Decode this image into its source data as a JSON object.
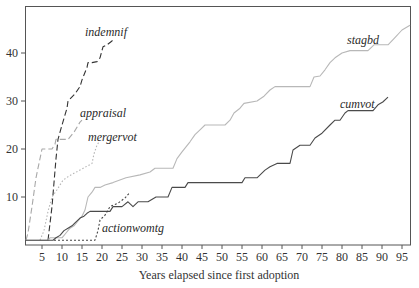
{
  "chart_data": {
    "type": "line",
    "title": "",
    "xlabel": "Years elapsed since first adoption",
    "ylabel": "",
    "xlim": [
      1,
      97
    ],
    "ylim": [
      0,
      50
    ],
    "grid": false,
    "legend": "inline labels",
    "x_ticks": [
      5,
      10,
      15,
      20,
      25,
      30,
      35,
      40,
      45,
      50,
      55,
      60,
      65,
      70,
      75,
      80,
      85,
      90,
      95
    ],
    "y_ticks": [
      10,
      20,
      30,
      40
    ],
    "series": [
      {
        "name": "indemnif",
        "color": "#333333",
        "dash": "6,3",
        "label_at": [
          15.75,
          43.5
        ],
        "points": [
          [
            6.5,
            1
          ],
          [
            7.5,
            8
          ],
          [
            8.5,
            18
          ],
          [
            9,
            22
          ],
          [
            10,
            25
          ],
          [
            11.25,
            28.5
          ],
          [
            11.5,
            30
          ],
          [
            13.25,
            31.5
          ],
          [
            14.5,
            33
          ],
          [
            15,
            34.4
          ],
          [
            16.25,
            37
          ],
          [
            16.5,
            38
          ],
          [
            17.5,
            38
          ],
          [
            18.75,
            38.2
          ],
          [
            19.5,
            39
          ],
          [
            20.25,
            41.3
          ],
          [
            21.25,
            41.7
          ],
          [
            22.5,
            42.5
          ],
          [
            23,
            43
          ]
        ]
      },
      {
        "name": "appraisal",
        "color": "#a8a8a8",
        "dash": "6,3",
        "label_at": [
          14.5,
          26.7
        ],
        "points": [
          [
            1,
            1
          ],
          [
            1.5,
            2.5
          ],
          [
            2.5,
            8
          ],
          [
            3.5,
            14
          ],
          [
            5,
            20
          ],
          [
            7.5,
            20
          ],
          [
            8.25,
            21
          ],
          [
            8.5,
            22
          ],
          [
            11.5,
            22
          ],
          [
            13,
            23.5
          ],
          [
            14.5,
            25.6
          ],
          [
            15,
            26
          ]
        ]
      },
      {
        "name": "mergervot",
        "color": "#b5b5b5",
        "dash": "1.5,2",
        "label_at": [
          16.5,
          21.7
        ],
        "points": [
          [
            4.5,
            1
          ],
          [
            5.5,
            3
          ],
          [
            6.5,
            7
          ],
          [
            7.5,
            10
          ],
          [
            8.75,
            11.5
          ],
          [
            10.25,
            13.5
          ],
          [
            12,
            14.5
          ],
          [
            14.5,
            15.6
          ],
          [
            17.5,
            17
          ],
          [
            18,
            19
          ],
          [
            18.75,
            20.8
          ],
          [
            19.25,
            21.5
          ]
        ]
      },
      {
        "name": "stagbd",
        "color": "#b8b8b8",
        "dash": "",
        "label_at": [
          81.25,
          41.9
        ],
        "points": [
          [
            1,
            1
          ],
          [
            6.5,
            1
          ],
          [
            7,
            1.5
          ],
          [
            10,
            1.5
          ],
          [
            11,
            2.5
          ],
          [
            12,
            3.5
          ],
          [
            13,
            4
          ],
          [
            14,
            5
          ],
          [
            15,
            6
          ],
          [
            15.75,
            7.3
          ],
          [
            16.5,
            10
          ],
          [
            17.5,
            11
          ],
          [
            18.25,
            12
          ],
          [
            19.5,
            12
          ],
          [
            20.75,
            12.5
          ],
          [
            22.75,
            13
          ],
          [
            26,
            14
          ],
          [
            29.5,
            14.6
          ],
          [
            32,
            15.2
          ],
          [
            33.25,
            16
          ],
          [
            37.75,
            16
          ],
          [
            38.75,
            18
          ],
          [
            40,
            19.4
          ],
          [
            42,
            21.5
          ],
          [
            43.25,
            23
          ],
          [
            44.5,
            24
          ],
          [
            45.75,
            25
          ],
          [
            50.75,
            25
          ],
          [
            52,
            26
          ],
          [
            53,
            27.5
          ],
          [
            54.5,
            28.5
          ],
          [
            55.5,
            29.5
          ],
          [
            58.75,
            30
          ],
          [
            60.5,
            31
          ],
          [
            62,
            32.3
          ],
          [
            63.25,
            33
          ],
          [
            72,
            33
          ],
          [
            73,
            35
          ],
          [
            74.5,
            35.2
          ],
          [
            75.75,
            36.5
          ],
          [
            77,
            38
          ],
          [
            78.25,
            39
          ],
          [
            80,
            40
          ],
          [
            82,
            40.5
          ],
          [
            86.5,
            40.5
          ],
          [
            88,
            41.7
          ],
          [
            91.5,
            41.7
          ],
          [
            93,
            43
          ],
          [
            95,
            44.8
          ],
          [
            97,
            45.8
          ]
        ]
      },
      {
        "name": "cumvot",
        "color": "#4a4a4a",
        "dash": "",
        "label_at": [
          79.5,
          28.5
        ],
        "points": [
          [
            1,
            1
          ],
          [
            7.75,
            1
          ],
          [
            8.5,
            1.5
          ],
          [
            9.5,
            2
          ],
          [
            10.5,
            3
          ],
          [
            11.5,
            3.5
          ],
          [
            12.5,
            4
          ],
          [
            13.25,
            4.6
          ],
          [
            14.5,
            5.6
          ],
          [
            15.5,
            6
          ],
          [
            16.25,
            6.6
          ],
          [
            17,
            7
          ],
          [
            22,
            7
          ],
          [
            22.75,
            8
          ],
          [
            25,
            8
          ],
          [
            26.5,
            9
          ],
          [
            27.75,
            8
          ],
          [
            29,
            9
          ],
          [
            31.5,
            9
          ],
          [
            33.5,
            10
          ],
          [
            36.5,
            10
          ],
          [
            37.5,
            12
          ],
          [
            40.75,
            12
          ],
          [
            41.5,
            13
          ],
          [
            55,
            13
          ],
          [
            55.75,
            14
          ],
          [
            58.75,
            14
          ],
          [
            60.75,
            15.6
          ],
          [
            62,
            16.3
          ],
          [
            63.75,
            17
          ],
          [
            67,
            17
          ],
          [
            67.75,
            19.8
          ],
          [
            69.5,
            20.8
          ],
          [
            72,
            20.8
          ],
          [
            73.25,
            22.3
          ],
          [
            75,
            23.3
          ],
          [
            77,
            25
          ],
          [
            78.25,
            26
          ],
          [
            79.5,
            26
          ],
          [
            80.75,
            27.5
          ],
          [
            81.5,
            28
          ],
          [
            87.75,
            28
          ],
          [
            89,
            29.2
          ],
          [
            90.2,
            29.8
          ],
          [
            91.5,
            30.8
          ]
        ]
      },
      {
        "name": "actionwomtg",
        "color": "#444444",
        "dash": "2,2",
        "label_at": [
          20,
          2.7
        ],
        "points": [
          [
            8,
            1
          ],
          [
            18.25,
            1
          ],
          [
            19,
            3
          ],
          [
            19.5,
            5.2
          ],
          [
            20.75,
            6.2
          ],
          [
            22,
            8
          ],
          [
            24,
            8.7
          ],
          [
            25.75,
            9.8
          ],
          [
            27,
            11
          ]
        ]
      }
    ]
  }
}
